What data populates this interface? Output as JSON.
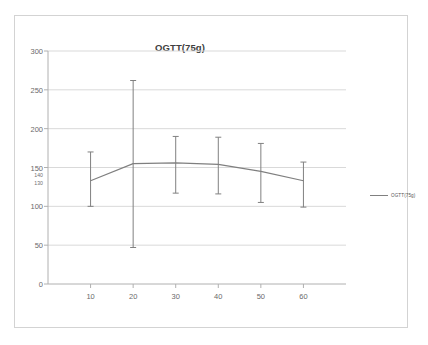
{
  "chart_data": {
    "type": "line",
    "title": "OGTT(75g)",
    "xlabel": "",
    "ylabel": "",
    "x": [
      10,
      20,
      30,
      40,
      50,
      60
    ],
    "categories": [
      "10",
      "20",
      "30",
      "40",
      "50",
      "60"
    ],
    "series": [
      {
        "name": "OGTT(75g)",
        "values": [
          133,
          155,
          156,
          154,
          145,
          133
        ],
        "error_low": [
          100,
          47,
          117,
          116,
          105,
          99
        ],
        "error_high": [
          170,
          262,
          190,
          189,
          181,
          157
        ]
      }
    ],
    "ylim": [
      0,
      300
    ],
    "xlim": [
      0,
      70
    ],
    "y_major_ticks": [
      0,
      50,
      100,
      150,
      200,
      250,
      300
    ],
    "y_minor_labels": [
      130,
      140
    ],
    "y_tick_labels": [
      "0",
      "50",
      "100",
      "130",
      "140",
      "150",
      "200",
      "250",
      "300"
    ],
    "x_tick_labels": [
      "10",
      "20",
      "30",
      "40",
      "50",
      "60"
    ],
    "grid": true,
    "grid_axis": "y",
    "legend": true,
    "legend_position": "right",
    "line_color": "#7f7f7f",
    "error_bar_color": "#808080",
    "grid_color": "#d9d9d9",
    "axis_color": "#b0b0b0",
    "border_color": "#d3d3d3",
    "title_color": "#404040",
    "tick_color": "#6a6a6a"
  },
  "legend": {
    "entries": [
      {
        "label": "OGTT(75g)"
      }
    ]
  }
}
